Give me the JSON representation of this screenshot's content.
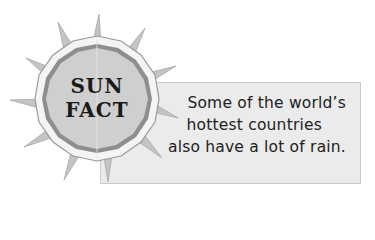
{
  "badge": {
    "line1": "SUN",
    "line2": "FACT"
  },
  "fact": {
    "lines": [
      "Some of the world’s",
      "hottest countries",
      "also have a lot of rain."
    ]
  },
  "colors": {
    "box_fill": "#ebebeb",
    "box_border": "#c9c9c9",
    "sun_fill": "#cfcfcf",
    "sun_ring": "#8e8e8e",
    "sun_outer": "#f2f2f2",
    "rays": "#bdbdbd",
    "text": "#222222"
  },
  "icons": {
    "sun": "sun-badge-icon"
  }
}
